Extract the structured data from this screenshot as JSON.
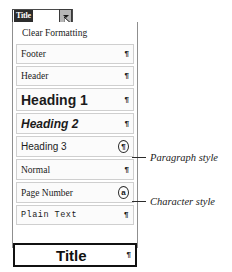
{
  "combo": {
    "value": "Title",
    "dropdown_arrow_icon": "chevron-down-icon",
    "cursor_icon": "mouse-pointer-icon"
  },
  "dropdown": {
    "items": [
      {
        "label": "Clear Formatting",
        "marker": "",
        "marker_kind": "none"
      },
      {
        "label": "Footer",
        "marker": "¶",
        "marker_kind": "pilcrow"
      },
      {
        "label": "Header",
        "marker": "¶",
        "marker_kind": "pilcrow"
      },
      {
        "label": "Heading 1",
        "marker": "¶",
        "marker_kind": "pilcrow"
      },
      {
        "label": "Heading 2",
        "marker": "¶",
        "marker_kind": "pilcrow"
      },
      {
        "label": "Heading 3",
        "marker": "¶",
        "marker_kind": "pilcrow-circled"
      },
      {
        "label": "Normal",
        "marker": "¶",
        "marker_kind": "pilcrow"
      },
      {
        "label": "Page Number",
        "marker": "a",
        "marker_kind": "char-circled"
      },
      {
        "label": "Plain Text",
        "marker": "¶",
        "marker_kind": "pilcrow"
      },
      {
        "label": "Title",
        "marker": "¶",
        "marker_kind": "pilcrow"
      }
    ]
  },
  "annotations": {
    "paragraph_style": "Paragraph style",
    "character_style": "Character style"
  },
  "colors": {
    "selection_background": "#2c2c2c",
    "selection_text": "#ffffff",
    "panel_border": "#8f8f8f",
    "item_border": "#cfcfcf",
    "item_background": "#fbfbfb",
    "selected_item_border": "#111111"
  }
}
